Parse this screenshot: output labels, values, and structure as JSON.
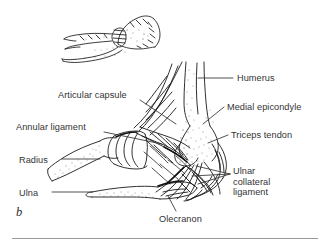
{
  "figure": {
    "marker": "b",
    "type": "anatomical-illustration",
    "style": "pen-and-ink line drawing with stipple shading",
    "background_color": "#ffffff",
    "ink_color": "#1a1a1a",
    "label_color": "#333333",
    "rule_color": "#9a9a9a"
  },
  "inset": {
    "name": "orientation-inset",
    "description": "small sketch of flexed elbow and forearm indicating viewing orientation"
  },
  "labels": [
    {
      "id": "articular-capsule",
      "text": "Articular capsule",
      "x": 58,
      "y": 90,
      "leader": "M 140 100 L 176 124",
      "side": "left"
    },
    {
      "id": "annular-ligament",
      "text": "Annular ligament",
      "x": 16,
      "y": 122,
      "leader": "M 104 132 L 162 144",
      "side": "left"
    },
    {
      "id": "radius",
      "text": "Radius",
      "x": 19,
      "y": 155,
      "leader": "M 62 159 L 100 159",
      "side": "left"
    },
    {
      "id": "ulna",
      "text": "Ulna",
      "x": 19,
      "y": 188,
      "leader": "M 52 192 L 92 192",
      "side": "left"
    },
    {
      "id": "humerus",
      "text": "Humerus",
      "x": 237,
      "y": 73,
      "leader": "M 233 78 L 198 78",
      "side": "right"
    },
    {
      "id": "medial-epicondyle",
      "text": "Medial epicondyle",
      "x": 227,
      "y": 102,
      "leader": "M 224 107 L 203 124",
      "side": "right"
    },
    {
      "id": "triceps-tendon",
      "text": "Triceps tendon",
      "x": 231,
      "y": 130,
      "leader": "M 228 135 L 208 143",
      "side": "right"
    },
    {
      "id": "ulnar-collateral-ligament",
      "text": "Ulnar\ncollateral\nligament",
      "x": 233,
      "y": 166,
      "leader": "M 230 174 L 196 166 M 230 174 L 192 176 M 230 174 L 198 184",
      "side": "right"
    },
    {
      "id": "olecranon",
      "text": "Olecranon",
      "x": 159,
      "y": 214,
      "leader": "M 176 211 L 168 196",
      "side": "bottom"
    }
  ]
}
